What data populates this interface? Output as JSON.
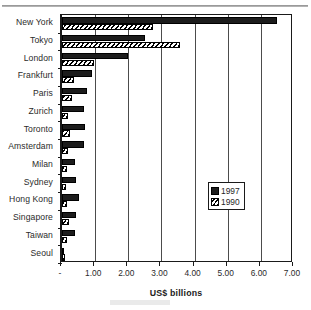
{
  "chart_data": {
    "type": "bar",
    "orientation": "horizontal",
    "title": "",
    "subtitle": "",
    "xlabel": "US$ billions",
    "ylabel": "",
    "xlim": [
      0,
      7
    ],
    "xticks": [
      0,
      1,
      2,
      3,
      4,
      5,
      6,
      7
    ],
    "xtick_labels": [
      "-",
      "1.00",
      "2.00",
      "3.00",
      "4.00",
      "5.00",
      "6.00",
      "7.00"
    ],
    "grid": true,
    "grid_axis": "x",
    "legend_position": "right-inside",
    "categories": [
      "New York",
      "Tokyo",
      "London",
      "Frankfurt",
      "Paris",
      "Zurich",
      "Toronto",
      "Amsterdam",
      "Milan",
      "Sydney",
      "Hong Kong",
      "Singapore",
      "Taiwan",
      "Seoul"
    ],
    "series": [
      {
        "name": "1997",
        "color": "#1c1c1c",
        "pattern": "solid",
        "values": [
          6.5,
          2.5,
          2.0,
          0.9,
          0.75,
          0.67,
          0.7,
          0.67,
          0.4,
          0.42,
          0.52,
          0.42,
          0.4,
          0.07
        ]
      },
      {
        "name": "1990",
        "color": "#ffffff",
        "pattern": "diagonal-hatch",
        "values": [
          2.75,
          3.55,
          0.96,
          0.36,
          0.3,
          0.19,
          0.25,
          0.18,
          0.14,
          0.13,
          0.15,
          0.22,
          0.16,
          0.06
        ]
      }
    ]
  },
  "legend": {
    "entries": [
      {
        "label": "1997",
        "swatch": "solid-black-square"
      },
      {
        "label": "1990",
        "swatch": "hatched-square"
      }
    ]
  },
  "axis": {
    "x_title": "US$ billions"
  },
  "colors": {
    "series_1997": "#1c1c1c",
    "series_1990": "#ffffff",
    "axis": "#1a1a1a",
    "gridline": "#4c4c4c",
    "text": "#2b2b2b",
    "background": "#ffffff"
  }
}
